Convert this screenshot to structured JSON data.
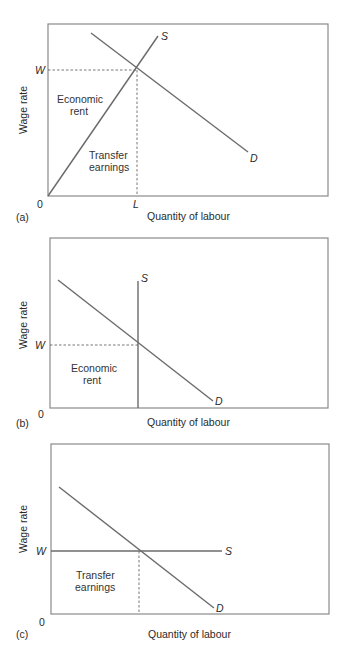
{
  "panels": [
    {
      "id": "a",
      "tag": "(a)",
      "y_axis_label": "Wage rate",
      "x_axis_label": "Quantity of labour",
      "origin_label": "0",
      "w_label": "W",
      "l_label": "L",
      "supply_label": "S",
      "demand_label": "D",
      "area_upper": [
        "Economic",
        "rent"
      ],
      "area_lower": [
        "Transfer",
        "earnings"
      ]
    },
    {
      "id": "b",
      "tag": "(b)",
      "y_axis_label": "Wage rate",
      "x_axis_label": "Quantity of labour",
      "origin_label": "0",
      "w_label": "W",
      "supply_label": "S",
      "demand_label": "D",
      "area": [
        "Economic",
        "rent"
      ]
    },
    {
      "id": "c",
      "tag": "(c)",
      "y_axis_label": "Wage rate",
      "x_axis_label": "Quantity of labour",
      "origin_label": "0",
      "w_label": "W",
      "supply_label": "S",
      "demand_label": "D",
      "area": [
        "Transfer",
        "earnings"
      ]
    }
  ],
  "colors": {
    "frame": "#8a8a8a",
    "curves": "#6b6b6b",
    "text": "#2a2a2a"
  }
}
